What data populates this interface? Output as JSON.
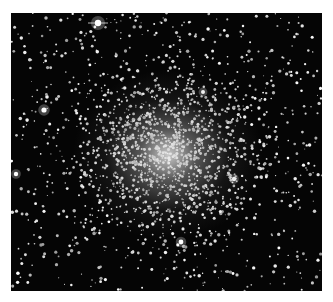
{
  "image": {
    "subject": "globular star cluster",
    "description": "Dense globular star cluster with bright center on black sky background",
    "colors": {
      "sky": "#050505",
      "stars": "#ffffff",
      "page_background": "#ffffff"
    },
    "cluster_center": {
      "x": 157,
      "y": 142
    },
    "bright_stars": [
      {
        "x": 87,
        "y": 10,
        "r": 3.2
      },
      {
        "x": 33,
        "y": 97,
        "r": 2.6
      },
      {
        "x": 5,
        "y": 161,
        "r": 2.2
      },
      {
        "x": 170,
        "y": 229,
        "r": 2.4
      },
      {
        "x": 223,
        "y": 166,
        "r": 2.2
      },
      {
        "x": 192,
        "y": 79,
        "r": 2.0
      }
    ]
  }
}
